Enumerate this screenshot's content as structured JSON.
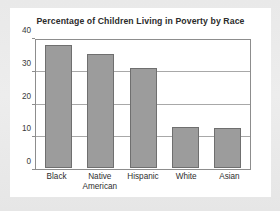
{
  "card": {
    "title": "Percentage of Children Living in Poverty by Race"
  },
  "chart_data": {
    "type": "bar",
    "title": "Percentage of Children Living in Poverty by Race",
    "xlabel": "",
    "ylabel": "",
    "ylim": [
      0,
      40
    ],
    "yticks": [
      "0",
      "10",
      "20",
      "30",
      "40"
    ],
    "grid": true,
    "legend": "none",
    "bar_color": "#9c9c9c",
    "bar_border_color": "#6f6f6f",
    "axis_color": "#8d8d8d",
    "gridline_color": "#a8a8a8",
    "categories": [
      "Black",
      "Native American",
      "Hispanic",
      "White",
      "Asian"
    ],
    "category_lines": [
      [
        "Black"
      ],
      [
        "Native",
        "American"
      ],
      [
        "Hispanic"
      ],
      [
        "White"
      ],
      [
        "Asian"
      ]
    ],
    "values": [
      38.8,
      36.0,
      31.5,
      13.0,
      12.6
    ]
  }
}
